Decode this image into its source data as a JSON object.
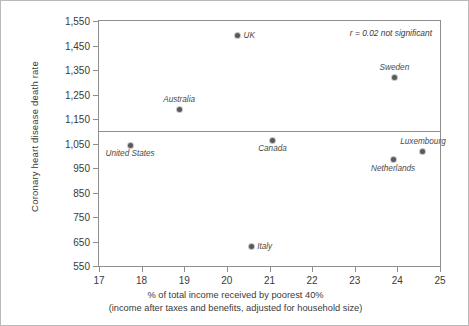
{
  "chart_data": {
    "type": "scatter",
    "title": "",
    "xlabel": "% of total income received by poorest 40%",
    "xlabel_line2": "(income after taxes and benefits, adjusted for household size)",
    "ylabel": "Coronary heart disease death rate",
    "xlim": [
      17,
      25
    ],
    "ylim": [
      550,
      1550
    ],
    "xticks": [
      "17",
      "18",
      "19",
      "20",
      "21",
      "22",
      "23",
      "24",
      "25"
    ],
    "xtick_values": [
      17,
      18,
      19,
      20,
      21,
      22,
      23,
      24,
      25
    ],
    "yticks": [
      "550",
      "650",
      "750",
      "850",
      "950",
      "1,050",
      "1,150",
      "1,250",
      "1,350",
      "1,450",
      "1,550"
    ],
    "ytick_values": [
      550,
      650,
      750,
      850,
      950,
      1050,
      1150,
      1250,
      1350,
      1450,
      1550
    ],
    "grid": false,
    "legend": "none",
    "reference_lines": [
      {
        "name": "horizontal-divider",
        "axis": "y",
        "value": 1100
      }
    ],
    "annotation": "r = 0.02 not significant",
    "points": [
      {
        "label": "UK",
        "x": 20.25,
        "y": 1492,
        "label_pos": "right"
      },
      {
        "label": "Sweden",
        "x": 23.93,
        "y": 1320,
        "label_pos": "above"
      },
      {
        "label": "Australia",
        "x": 18.88,
        "y": 1190,
        "label_pos": "above"
      },
      {
        "label": "Canada",
        "x": 21.07,
        "y": 1063,
        "label_pos": "below"
      },
      {
        "label": "United States",
        "x": 17.73,
        "y": 1043,
        "label_pos": "below"
      },
      {
        "label": "Luxembourg",
        "x": 24.6,
        "y": 1018,
        "label_pos": "above"
      },
      {
        "label": "Netherlands",
        "x": 23.9,
        "y": 983,
        "label_pos": "below"
      },
      {
        "label": "Italy",
        "x": 20.57,
        "y": 630,
        "label_pos": "right"
      }
    ],
    "colors": {
      "point": "#595959",
      "axis": "#8e8e8e",
      "text": "#3a3a3a",
      "background": "#ffffff",
      "border": "#b9b9b9"
    }
  }
}
